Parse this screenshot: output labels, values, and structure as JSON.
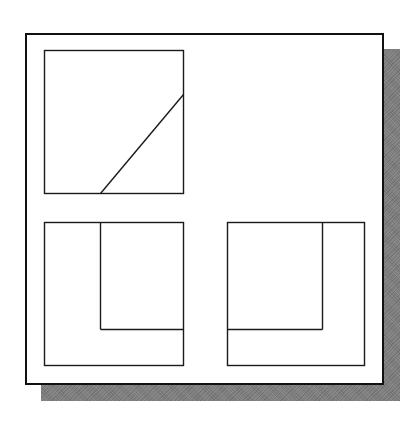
{
  "figure": {
    "canvas": {
      "width": 418,
      "height": 424
    },
    "colors": {
      "line": "#1a1a1a",
      "frame_border": "#111111",
      "shadow": "#7c7c7c",
      "paper": "#ffffff"
    },
    "sheet": {
      "x": 25,
      "y": 33,
      "w": 359,
      "h": 352,
      "shadow_offset": 16
    },
    "views": [
      {
        "name": "top-view",
        "rect": {
          "x": 44,
          "y": 50,
          "w": 139,
          "h": 143
        },
        "lines": [
          {
            "name": "inclined-edge",
            "x1": 100,
            "y1": 193,
            "x2": 183,
            "y2": 94
          }
        ]
      },
      {
        "name": "front-view",
        "rect": {
          "x": 44,
          "y": 222,
          "w": 139,
          "h": 143
        },
        "lines": [
          {
            "name": "inner-vertical-edge",
            "x1": 100,
            "y1": 222,
            "x2": 100,
            "y2": 329
          },
          {
            "name": "inner-horizontal-edge",
            "x1": 100,
            "y1": 329,
            "x2": 183,
            "y2": 329
          }
        ]
      },
      {
        "name": "side-view",
        "rect": {
          "x": 227,
          "y": 222,
          "w": 137,
          "h": 143
        },
        "lines": [
          {
            "name": "inner-vertical-edge",
            "x1": 322,
            "y1": 222,
            "x2": 322,
            "y2": 329
          },
          {
            "name": "inner-horizontal-edge",
            "x1": 227,
            "y1": 329,
            "x2": 322,
            "y2": 329
          }
        ]
      }
    ]
  }
}
